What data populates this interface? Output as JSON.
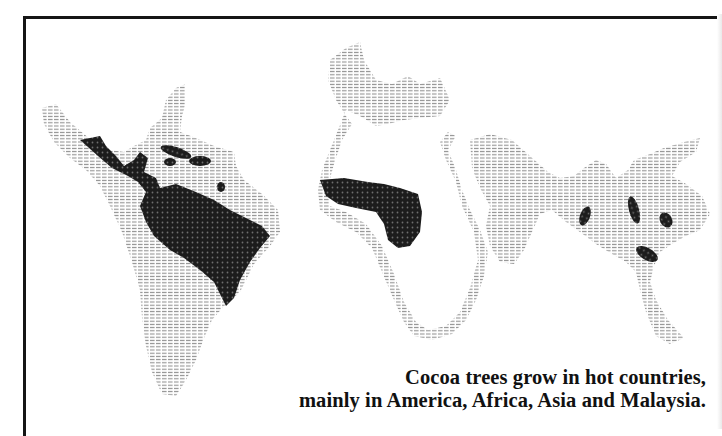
{
  "figure": {
    "type": "illustrated world map",
    "legend_meaning": "dark dotted areas = cocoa growing regions",
    "regions": [
      {
        "name": "Central & South America",
        "label": "America"
      },
      {
        "name": "West Africa",
        "label": "Africa"
      },
      {
        "name": "South-East Asia",
        "label": "Asia"
      },
      {
        "name": "Malaysia / Indonesia islands",
        "label": "Malaysia"
      }
    ],
    "colors": {
      "cocoa_area": "#1e1e1e",
      "land_hatching": "#9a9a9a",
      "frame": "#151515",
      "background": "#ffffff"
    }
  },
  "caption": {
    "line1": "Cocoa trees grow in hot countries,",
    "line2": "mainly in America, Africa, Asia and Malaysia."
  }
}
